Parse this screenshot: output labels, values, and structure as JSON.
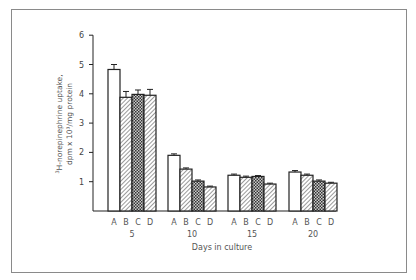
{
  "chart_data": {
    "type": "bar",
    "title": "",
    "xlabel": "Days in culture",
    "ylabel_line1": "3H-norepinephrine uptake,",
    "ylabel_line2": "dpm x 10³/mg protein",
    "ylim": [
      0,
      6
    ],
    "yticks": [
      "1",
      "2",
      "3",
      "4",
      "5",
      "6"
    ],
    "categories": [
      "5",
      "10",
      "15",
      "20"
    ],
    "bar_labels": [
      "A",
      "B",
      "C",
      "D"
    ],
    "series": [
      {
        "name": "A",
        "pattern": "open",
        "values": [
          4.83,
          1.9,
          1.22,
          1.33
        ],
        "errors": [
          0.17,
          0.05,
          0.04,
          0.05
        ]
      },
      {
        "name": "B",
        "pattern": "diagonal-hatch",
        "values": [
          3.88,
          1.43,
          1.15,
          1.22
        ],
        "errors": [
          0.2,
          0.04,
          0.04,
          0.04
        ]
      },
      {
        "name": "C",
        "pattern": "crosshatch-dark",
        "values": [
          3.98,
          1.02,
          1.18,
          1.02
        ],
        "errors": [
          0.15,
          0.04,
          0.03,
          0.04
        ]
      },
      {
        "name": "D",
        "pattern": "diagonal-hatch",
        "values": [
          3.95,
          0.82,
          0.92,
          0.95
        ],
        "errors": [
          0.2,
          0.03,
          0.03,
          0.03
        ]
      }
    ],
    "grid": false,
    "legend": "none (bars labeled A-D under each group)"
  },
  "colors": {
    "line": "#222222",
    "frame": "#8a8a8a",
    "background": "#ffffff"
  }
}
